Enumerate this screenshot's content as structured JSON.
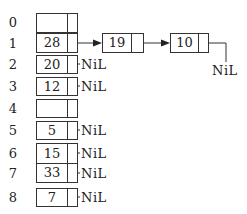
{
  "diagram": {
    "type": "hash-table-with-chaining",
    "null_label": "NiL",
    "slots": [
      {
        "index": "0",
        "key": "",
        "next": null
      },
      {
        "index": "1",
        "key": "28",
        "next": "chain"
      },
      {
        "index": "2",
        "key": "20",
        "next": "NiL"
      },
      {
        "index": "3",
        "key": "12",
        "next": "NiL"
      },
      {
        "index": "4",
        "key": "",
        "next": null
      },
      {
        "index": "5",
        "key": "5",
        "next": "NiL"
      },
      {
        "index": "6",
        "key": "15",
        "next": "NiL"
      },
      {
        "index": "7",
        "key": "33",
        "next": "NiL"
      },
      {
        "index": "8",
        "key": "7",
        "next": "NiL"
      }
    ],
    "chain_slot_1": [
      {
        "key": "19"
      },
      {
        "key": "10",
        "next": "NiL"
      }
    ],
    "colors": {
      "line": "#333333",
      "text": "#222222",
      "background": "#ffffff"
    }
  }
}
